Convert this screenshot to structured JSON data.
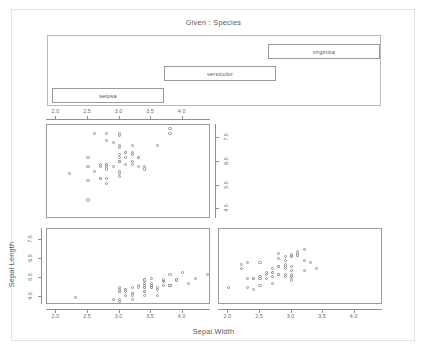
{
  "figure": {
    "given_title": "Given : Species",
    "x_axis_title": "Sepal.Width",
    "y_axis_title": "Sepal Length",
    "frame_color": "#e2e2e2",
    "panel_border_color": "#9b9b9b",
    "point_color": "#8f8f8f",
    "text_color": "#5a5a5a"
  },
  "shingles": [
    {
      "label": "setosa",
      "left": 4,
      "top": 52,
      "width": 112,
      "height": 15
    },
    {
      "label": "versicolor",
      "left": 116,
      "top": 30,
      "width": 112,
      "height": 15
    },
    {
      "label": "virginica",
      "left": 220,
      "top": 8,
      "width": 112,
      "height": 15
    }
  ],
  "axes": {
    "x_ticks": [
      "2.0",
      "2.5",
      "3.0",
      "3.5",
      "4.0"
    ],
    "x_tick_values": [
      2.0,
      2.5,
      3.0,
      3.5,
      4.0
    ],
    "y_ticks": [
      "4.5",
      "5.5",
      "6.5",
      "7.5"
    ],
    "y_tick_values": [
      4.5,
      5.5,
      6.5,
      7.5
    ],
    "xlim": [
      1.85,
      4.45
    ],
    "ylim": [
      4.1,
      8.05
    ]
  },
  "chart_data": {
    "type": "scatter",
    "title": "Given : Species",
    "xlabel": "Sepal.Width",
    "ylabel": "Sepal Length",
    "conditioning_variable": "Species",
    "conditioning_levels": [
      "setosa",
      "versicolor",
      "virginica"
    ],
    "xlim": [
      1.85,
      4.45
    ],
    "ylim": [
      4.1,
      8.05
    ],
    "xticks": [
      2.0,
      2.5,
      3.0,
      3.5,
      4.0
    ],
    "yticks": [
      4.5,
      5.5,
      6.5,
      7.5
    ],
    "grid": false,
    "legend": "none",
    "panels": [
      {
        "name": "setosa",
        "position": "bottom-left",
        "x_axis_side": "bottom",
        "y_axis_side": "left",
        "x": [
          3.5,
          3.0,
          3.2,
          3.1,
          3.6,
          3.9,
          3.4,
          3.4,
          2.9,
          3.1,
          3.7,
          3.4,
          3.0,
          3.0,
          4.0,
          4.4,
          3.9,
          3.5,
          3.8,
          3.8,
          3.4,
          3.7,
          3.6,
          3.3,
          3.4,
          3.0,
          3.4,
          3.5,
          3.4,
          3.2,
          3.1,
          3.4,
          4.1,
          4.2,
          3.1,
          3.2,
          3.5,
          3.6,
          3.0,
          3.4,
          3.5,
          2.3,
          3.2,
          3.5,
          3.8,
          3.0,
          3.8,
          3.2,
          3.7,
          3.3
        ],
        "y": [
          5.1,
          4.9,
          4.7,
          4.6,
          5.0,
          5.4,
          4.6,
          5.0,
          4.4,
          4.9,
          5.4,
          4.8,
          4.8,
          4.3,
          5.8,
          5.7,
          5.4,
          5.1,
          5.7,
          5.1,
          5.4,
          5.1,
          4.6,
          5.1,
          4.8,
          5.0,
          5.0,
          5.2,
          5.2,
          4.7,
          4.8,
          5.4,
          5.2,
          5.5,
          4.9,
          5.0,
          5.5,
          4.9,
          4.4,
          5.1,
          5.0,
          4.5,
          4.4,
          5.0,
          5.1,
          4.8,
          5.1,
          4.6,
          5.3,
          5.0
        ]
      },
      {
        "name": "versicolor",
        "position": "bottom-right",
        "x_axis_side": "bottom",
        "y_axis_side": "none",
        "x": [
          3.2,
          3.2,
          3.1,
          2.3,
          2.8,
          2.8,
          3.3,
          2.4,
          2.9,
          2.7,
          2.0,
          3.0,
          2.2,
          2.9,
          2.9,
          3.1,
          3.0,
          2.7,
          2.2,
          2.5,
          3.2,
          2.8,
          2.5,
          2.8,
          2.9,
          3.0,
          2.8,
          3.0,
          2.9,
          2.6,
          2.4,
          2.4,
          2.7,
          2.7,
          3.0,
          3.4,
          3.1,
          2.3,
          3.0,
          2.5,
          2.6,
          3.0,
          2.6,
          2.3,
          2.7,
          3.0,
          2.9,
          2.9,
          2.5,
          2.8
        ],
        "y": [
          7.0,
          6.4,
          6.9,
          5.5,
          6.5,
          5.7,
          6.3,
          4.9,
          6.6,
          5.2,
          5.0,
          5.9,
          6.0,
          6.1,
          5.6,
          6.7,
          5.6,
          5.8,
          6.2,
          5.6,
          5.9,
          6.1,
          6.3,
          6.1,
          6.4,
          6.6,
          6.8,
          6.7,
          6.0,
          5.7,
          5.5,
          5.5,
          5.8,
          6.0,
          5.4,
          6.0,
          6.7,
          6.3,
          5.6,
          5.5,
          5.5,
          6.1,
          5.8,
          5.0,
          5.6,
          5.7,
          5.7,
          6.2,
          5.1,
          5.7
        ]
      },
      {
        "name": "virginica",
        "position": "top-left",
        "x_axis_side": "top",
        "y_axis_side": "right",
        "x": [
          3.3,
          2.7,
          3.0,
          2.9,
          3.0,
          3.0,
          2.5,
          2.9,
          2.5,
          3.6,
          3.2,
          2.7,
          3.0,
          2.5,
          2.8,
          3.2,
          3.0,
          3.8,
          2.6,
          2.2,
          3.2,
          2.8,
          2.8,
          2.7,
          3.3,
          3.2,
          2.8,
          3.0,
          2.8,
          3.0,
          2.8,
          3.8,
          2.8,
          2.8,
          2.6,
          3.0,
          3.4,
          3.1,
          3.0,
          3.1,
          3.1,
          3.1,
          2.7,
          3.2,
          3.3,
          3.0,
          2.5,
          3.0,
          3.4,
          3.0
        ],
        "y": [
          6.3,
          5.8,
          7.1,
          6.3,
          6.5,
          7.6,
          4.9,
          7.3,
          6.7,
          7.2,
          6.5,
          6.4,
          6.8,
          5.7,
          5.8,
          6.4,
          6.5,
          7.7,
          7.7,
          6.0,
          6.9,
          5.6,
          7.7,
          6.3,
          6.7,
          7.2,
          6.2,
          6.1,
          6.4,
          7.2,
          7.4,
          7.9,
          6.4,
          6.3,
          6.1,
          7.7,
          6.3,
          6.4,
          6.0,
          6.9,
          6.7,
          6.9,
          5.8,
          6.8,
          6.7,
          6.7,
          6.3,
          6.5,
          6.2,
          5.9
        ]
      }
    ]
  }
}
